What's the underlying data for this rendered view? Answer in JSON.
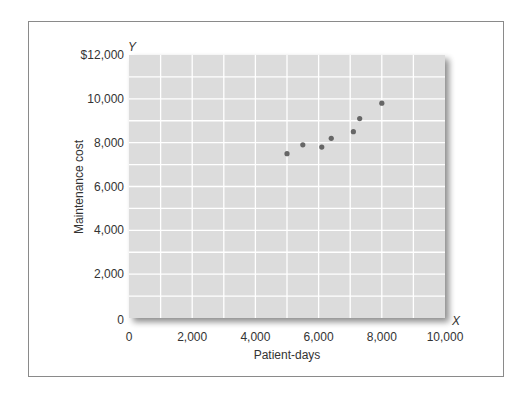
{
  "chart_data": {
    "type": "scatter",
    "title": "",
    "xlabel": "Patient-days",
    "ylabel": "Maintenance cost",
    "x_axis_letter": "X",
    "y_axis_letter": "Y",
    "xlim": [
      0,
      10000
    ],
    "ylim": [
      0,
      12000
    ],
    "x_ticks": [
      0,
      2000,
      4000,
      6000,
      8000,
      10000
    ],
    "x_tick_labels": [
      "0",
      "2,000",
      "4,000",
      "6,000",
      "8,000",
      "10,000"
    ],
    "y_ticks": [
      0,
      2000,
      4000,
      6000,
      8000,
      10000,
      12000
    ],
    "y_tick_labels": [
      "0",
      "2,000",
      "4,000",
      "6,000",
      "8,000",
      "10,000",
      "$12,000"
    ],
    "grid": true,
    "grid_step_x": 1000,
    "grid_step_y": 1000,
    "legend": null,
    "points": [
      {
        "x": 5000,
        "y": 7500
      },
      {
        "x": 5500,
        "y": 7900
      },
      {
        "x": 6100,
        "y": 7800
      },
      {
        "x": 6400,
        "y": 8200
      },
      {
        "x": 7100,
        "y": 8500
      },
      {
        "x": 7300,
        "y": 9100
      },
      {
        "x": 8000,
        "y": 9800
      }
    ],
    "colors": {
      "plot_background": "#dcdcdc",
      "grid": "#ffffff",
      "point": "#666666",
      "frame": "#8a8a8a"
    }
  }
}
